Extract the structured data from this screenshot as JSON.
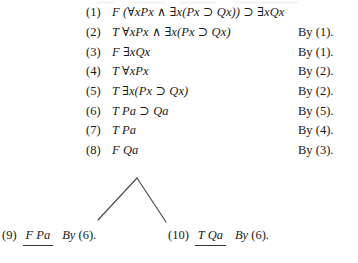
{
  "document": {
    "kind": "logic-proof-tree",
    "ink_color": "#1a1a1a",
    "rule_color": "#3a3a3a"
  },
  "proof": {
    "lines": [
      {
        "num": "(1)",
        "formula": "F (∀xPx ∧ ∃x(Px ⊃ Qx)) ⊃ ∃xQx",
        "justification": ""
      },
      {
        "num": "(2)",
        "formula": "T ∀xPx ∧ ∃x(Px ⊃ Qx)",
        "justification": "By (1)."
      },
      {
        "num": "(3)",
        "formula": "F ∃xQx",
        "justification": "By (1)."
      },
      {
        "num": "(4)",
        "formula": "T ∀xPx",
        "justification": "By (2)."
      },
      {
        "num": "(5)",
        "formula": "T ∃x(Px ⊃ Qx)",
        "justification": "By (2)."
      },
      {
        "num": "(6)",
        "formula": "T Pa ⊃ Qa",
        "justification": "By (5)."
      },
      {
        "num": "(7)",
        "formula": "T Pa",
        "justification": "By (4)."
      },
      {
        "num": "(8)",
        "formula": "F Qa",
        "justification": "By (3)."
      }
    ],
    "branches": [
      {
        "num": "(9)",
        "formula": "F Pa",
        "by_word": "By",
        "by_ref": "(6).",
        "closed": true
      },
      {
        "num": "(10)",
        "formula": "T Qa",
        "by_word": "By",
        "by_ref": "(6).",
        "closed": true
      }
    ],
    "fork": {
      "apex_x": 137,
      "apex_y": 8,
      "left_end_x": 98,
      "left_end_y": 50,
      "right_end_x": 166,
      "right_end_y": 52
    }
  }
}
